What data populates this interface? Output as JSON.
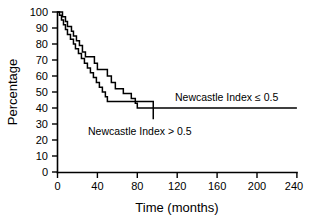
{
  "chart_data": {
    "type": "line",
    "title": "",
    "xlabel": "Time (months)",
    "ylabel": "Percentage",
    "xlim": [
      0,
      240
    ],
    "ylim": [
      0,
      100
    ],
    "grid": false,
    "legend_position": "inline-annotations",
    "xticks": [
      "0",
      "40",
      "80",
      "120",
      "160",
      "200",
      "240"
    ],
    "xtick_values": [
      0,
      40,
      80,
      120,
      160,
      200,
      240
    ],
    "yticks": [
      "0",
      "10",
      "20",
      "30",
      "40",
      "50",
      "60",
      "70",
      "80",
      "90",
      "100"
    ],
    "ytick_values": [
      0,
      10,
      20,
      30,
      40,
      50,
      60,
      70,
      80,
      90,
      100
    ],
    "series": [
      {
        "name": "Newcastle Index ≤ 0.5",
        "step": "post",
        "x": [
          0,
          3,
          5,
          8,
          10,
          12,
          14,
          16,
          19,
          22,
          25,
          28,
          31,
          34,
          37,
          40,
          44,
          47,
          50,
          54,
          58,
          62,
          66,
          70,
          74,
          78,
          80,
          240
        ],
        "values": [
          100,
          100,
          97,
          94,
          91,
          91,
          88,
          85,
          82,
          79,
          75,
          72,
          72,
          72,
          68,
          64,
          64,
          64,
          60,
          56,
          52,
          52,
          49,
          49,
          46,
          43,
          40,
          40
        ]
      },
      {
        "name": "Newcastle Index > 0.5",
        "step": "post",
        "x": [
          0,
          2,
          4,
          6,
          8,
          10,
          13,
          16,
          18,
          21,
          24,
          27,
          30,
          33,
          36,
          39,
          42,
          45,
          48,
          50,
          60,
          96
        ],
        "values": [
          100,
          98,
          95,
          92,
          89,
          86,
          83,
          80,
          77,
          74,
          71,
          68,
          65,
          62,
          59,
          56,
          53,
          50,
          47,
          44,
          44,
          33
        ]
      }
    ],
    "annotations": [
      {
        "name": "label-le",
        "text": "Newcastle Index ≤ 0.5",
        "x": 135,
        "y": 48
      },
      {
        "name": "label-gt",
        "text": "Newcastle Index > 0.5",
        "x": 48,
        "y": 25
      }
    ]
  },
  "colors": {
    "axis": "#000000",
    "curve_le": "#000000",
    "curve_gt": "#000000",
    "background": "#ffffff"
  }
}
